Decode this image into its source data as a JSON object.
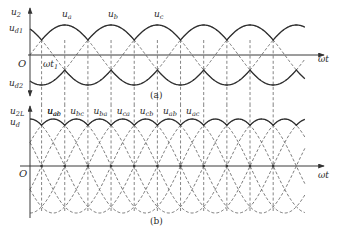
{
  "figure": {
    "panel_a": {
      "caption": "(a)",
      "y_label_top": {
        "base": "u",
        "sub": "2"
      },
      "y_label_d1": {
        "base": "u",
        "sub": "d1"
      },
      "y_label_d2": {
        "base": "u",
        "sub": "d2"
      },
      "origin_label": "O",
      "x_label": "ωt",
      "marker_label": {
        "base": "ωt",
        "sub": "1"
      },
      "phase_labels": [
        {
          "base": "u",
          "sub": "a"
        },
        {
          "base": "u",
          "sub": "b"
        },
        {
          "base": "u",
          "sub": "c"
        }
      ]
    },
    "panel_b": {
      "caption": "(b)",
      "y_label_top": {
        "base": "u",
        "sub": "2L"
      },
      "y_label_d": {
        "base": "u",
        "sub": "d"
      },
      "origin_label": "O",
      "x_label": "ωt",
      "line_labels": [
        {
          "base": "u",
          "sub": "ab"
        },
        {
          "base": "u",
          "sub": "ac"
        },
        {
          "base": "u",
          "sub": "bc"
        },
        {
          "base": "u",
          "sub": "ba"
        },
        {
          "base": "u",
          "sub": "ca"
        },
        {
          "base": "u",
          "sub": "cb"
        },
        {
          "base": "u",
          "sub": "ab"
        },
        {
          "base": "u",
          "sub": "ac"
        }
      ]
    }
  },
  "chart_data": [
    {
      "type": "line",
      "title": "(a) Three-phase phase voltages with upper/lower envelopes u_d1, u_d2",
      "xlabel": "ωt",
      "ylabel": "u2",
      "x_unit": "degrees",
      "x_range_deg": [
        0,
        712
      ],
      "series": [
        {
          "name": "u_a",
          "amplitude": 1.0,
          "phase_deg": 0
        },
        {
          "name": "u_b",
          "amplitude": 1.0,
          "phase_deg": -120
        },
        {
          "name": "u_c",
          "amplitude": 1.0,
          "phase_deg": -240
        }
      ],
      "envelopes": {
        "u_d1": "max(u_a,u_b,u_c) solid",
        "u_d2": "min(u_a,u_b,u_c) solid"
      },
      "annotations": [
        "ωt1 at natural commutation point 30°"
      ],
      "vertical_dashed_at_deg": [
        30,
        90,
        150,
        210,
        270,
        330,
        390,
        450,
        510,
        570,
        630
      ]
    },
    {
      "type": "line",
      "title": "(b) Line voltages u_2L and output u_d envelope",
      "xlabel": "ωt",
      "ylabel": "u2L, ud",
      "x_unit": "degrees",
      "x_range_deg": [
        0,
        712
      ],
      "series": [
        {
          "name": "u_ab",
          "amplitude": 1.732,
          "phase_deg": 30
        },
        {
          "name": "u_ac",
          "amplitude": 1.732,
          "phase_deg": -30
        },
        {
          "name": "u_bc",
          "amplitude": 1.732,
          "phase_deg": -90
        },
        {
          "name": "u_ba",
          "amplitude": 1.732,
          "phase_deg": -150
        },
        {
          "name": "u_ca",
          "amplitude": 1.732,
          "phase_deg": 150
        },
        {
          "name": "u_cb",
          "amplitude": 1.732,
          "phase_deg": 90
        }
      ],
      "envelopes": {
        "u_d": "max of line voltages, solid"
      },
      "vertical_dashed_at_deg": [
        30,
        90,
        150,
        210,
        270,
        330,
        390,
        450,
        510,
        570,
        630
      ]
    }
  ],
  "layout": {
    "origin_x": 30,
    "px_per_deg": 0.386,
    "end_deg": 712,
    "axis_end_x": 324,
    "a": {
      "axis_y": 55,
      "amp_px": 30,
      "yaxis_top": 8,
      "yaxis_bottom": 96
    },
    "b": {
      "axis_y": 166,
      "amp_px": 47,
      "yaxis_top": 106,
      "yaxis_bottom": 218
    }
  }
}
